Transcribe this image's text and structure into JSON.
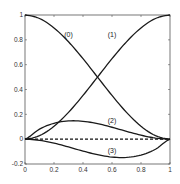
{
  "chart_data": {
    "type": "line",
    "title": "",
    "xlabel": "",
    "ylabel": "",
    "xlim": [
      0,
      1
    ],
    "ylim": [
      -0.2,
      1
    ],
    "grid": false,
    "legend": "none (curves labeled inline)",
    "xticks": [
      "0",
      "0.2",
      "0.4",
      "0.6",
      "0.8",
      "1"
    ],
    "xtick_values": [
      0,
      0.2,
      0.4,
      0.6,
      0.8,
      1
    ],
    "yticks": [
      "-0.2",
      "0",
      "0.2",
      "0.4",
      "0.6",
      "0.8",
      "1"
    ],
    "ytick_values": [
      -0.2,
      0,
      0.2,
      0.4,
      0.6,
      0.8,
      1
    ],
    "x": [
      0,
      0.1,
      0.2,
      0.3,
      0.4,
      0.5,
      0.6,
      0.7,
      0.8,
      0.9,
      1
    ],
    "series": [
      {
        "name": "(0)",
        "label": "(0)",
        "label_pos": [
          0.3,
          0.82
        ],
        "values": [
          1,
          0.972,
          0.896,
          0.784,
          0.648,
          0.5,
          0.352,
          0.216,
          0.104,
          0.028,
          0
        ]
      },
      {
        "name": "(1)",
        "label": "(1)",
        "label_pos": [
          0.6,
          0.82
        ],
        "values": [
          0,
          0.028,
          0.104,
          0.216,
          0.352,
          0.5,
          0.648,
          0.784,
          0.896,
          0.972,
          1
        ]
      },
      {
        "name": "(2)",
        "label": "(2)",
        "label_pos": [
          0.6,
          0.13
        ],
        "values": [
          0,
          0.081,
          0.128,
          0.147,
          0.144,
          0.125,
          0.096,
          0.063,
          0.032,
          0.009,
          0
        ]
      },
      {
        "name": "(3)",
        "label": "(3)",
        "label_pos": [
          0.6,
          -0.11
        ],
        "values": [
          0,
          -0.009,
          -0.032,
          -0.063,
          -0.096,
          -0.125,
          -0.144,
          -0.147,
          -0.128,
          -0.081,
          0
        ]
      }
    ],
    "reference_line": {
      "y": 0,
      "style": "dashed"
    }
  }
}
